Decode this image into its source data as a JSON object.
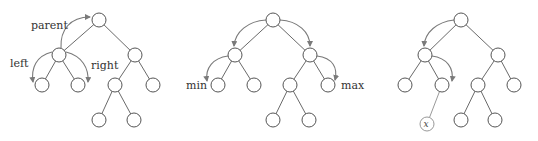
{
  "diagram": {
    "type": "binary-tree-navigation",
    "colors": {
      "edge": "#6a6a6a",
      "node_stroke": "#555555",
      "arrow": "#7a7a7a",
      "label": "#333333"
    },
    "panels": [
      {
        "id": "tree1",
        "labels": {
          "parent": "parent",
          "left": "left",
          "right": "right"
        }
      },
      {
        "id": "tree2",
        "labels": {
          "min": "min",
          "max": "max"
        }
      },
      {
        "id": "tree3",
        "labels": {
          "x": "x"
        }
      }
    ]
  }
}
